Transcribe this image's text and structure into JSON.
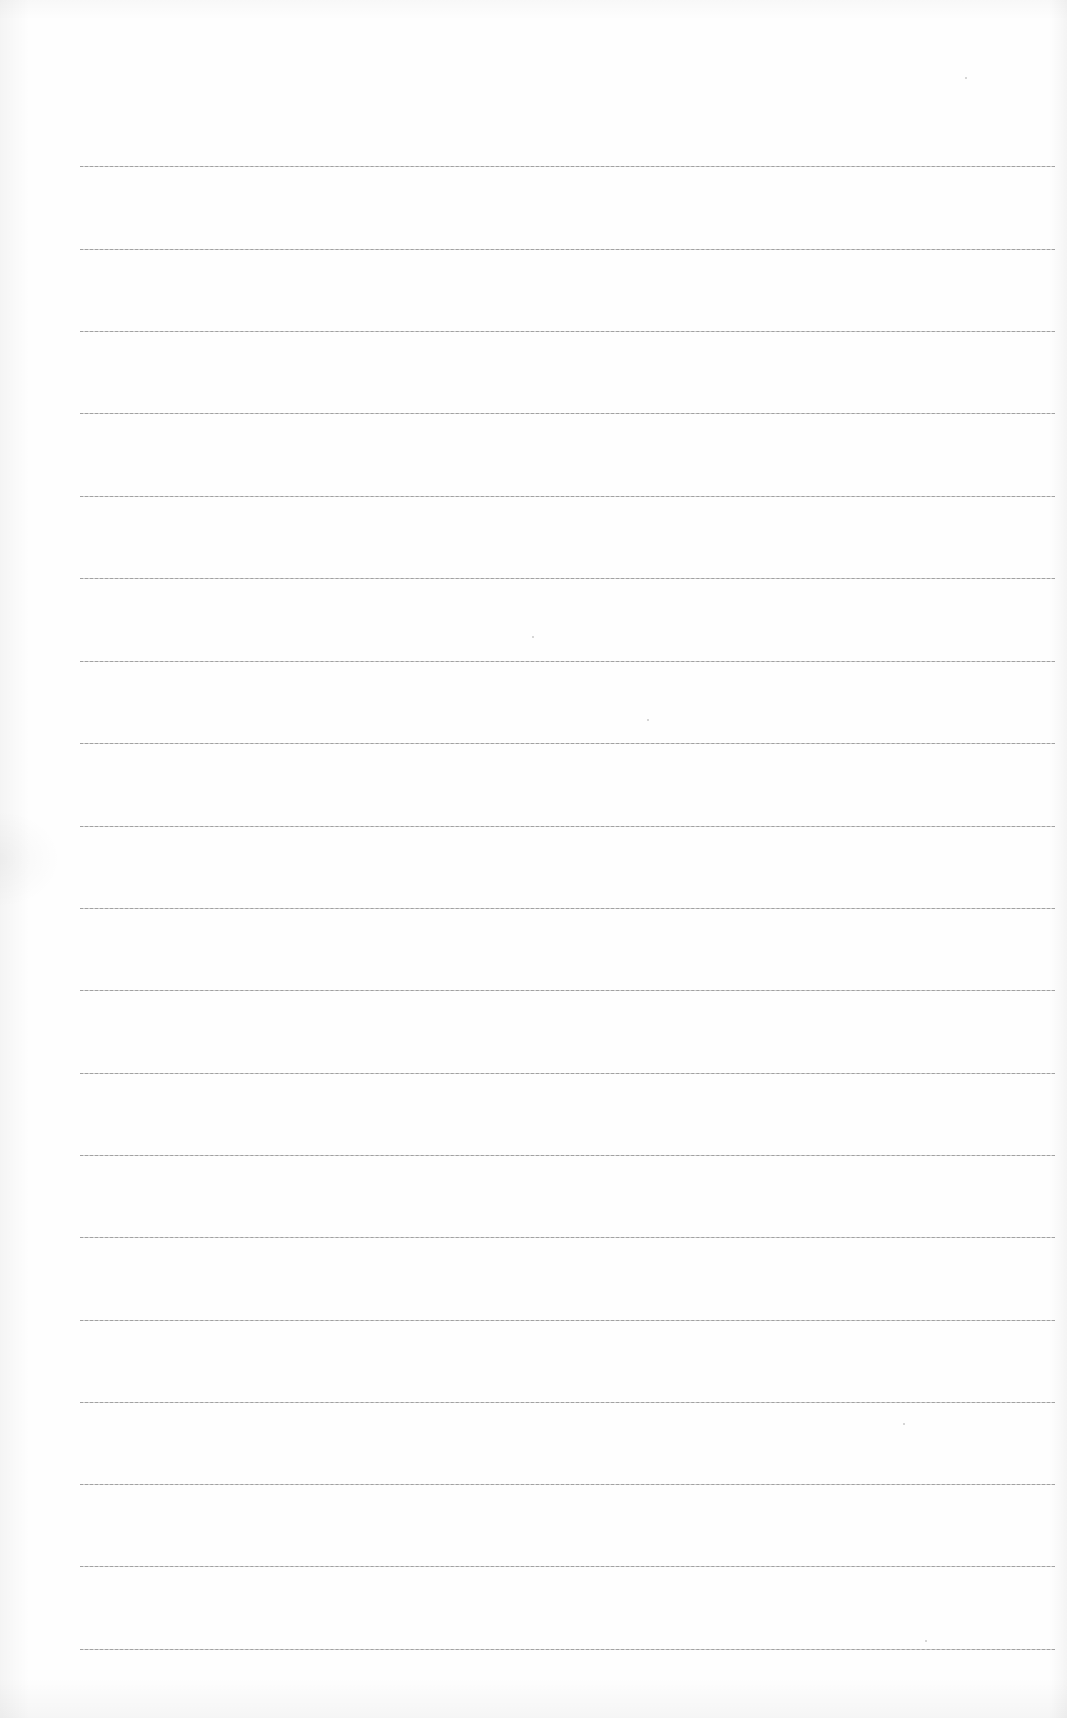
{
  "document": {
    "type": "blank lined paper",
    "background_color": "#fefefe",
    "rule_color": "#a3a3a3",
    "rule_count": 19,
    "rule_left_px": 80,
    "rule_right_px": 1055,
    "rule_positions_y": [
      166,
      249,
      331,
      413,
      496,
      578,
      661,
      743,
      826,
      908,
      990,
      1073,
      1155,
      1237,
      1320,
      1402,
      1484,
      1566,
      1649
    ],
    "text_content": ""
  }
}
